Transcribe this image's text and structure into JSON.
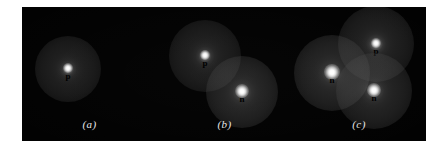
{
  "figure": {
    "background_color": "#ffffff",
    "plate_color": "#000000",
    "label_color": "#000000",
    "caption_color": "#e8e8e8",
    "glow_color": "#ffffff"
  },
  "panels": [
    {
      "id": "a",
      "caption": "(a)",
      "nucleons": [
        {
          "label": "p",
          "kind": "proton",
          "cx": 46,
          "cy": 62,
          "r": 33,
          "core_r": 5,
          "brightness": 0.82
        }
      ]
    },
    {
      "id": "b",
      "caption": "(b)",
      "nucleons": [
        {
          "label": "p",
          "kind": "proton",
          "cx": 48,
          "cy": 49,
          "r": 36,
          "core_r": 5,
          "brightness": 0.8
        },
        {
          "label": "n",
          "kind": "neutron",
          "cx": 85,
          "cy": 85,
          "r": 36,
          "core_r": 7,
          "brightness": 1.0
        }
      ]
    },
    {
      "id": "c",
      "caption": "(c)",
      "nucleons": [
        {
          "label": "p",
          "kind": "proton",
          "cx": 84,
          "cy": 37,
          "r": 38,
          "core_r": 5,
          "brightness": 0.84
        },
        {
          "label": "n",
          "kind": "neutron",
          "cx": 40,
          "cy": 66,
          "r": 38,
          "core_r": 8,
          "brightness": 1.0
        },
        {
          "label": "n",
          "kind": "neutron",
          "cx": 82,
          "cy": 84,
          "r": 38,
          "core_r": 7,
          "brightness": 0.94
        }
      ]
    }
  ]
}
